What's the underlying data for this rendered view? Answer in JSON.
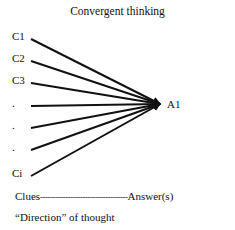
{
  "title": "Convergent thinking",
  "clues": [
    {
      "label": "C1",
      "y": 39
    },
    {
      "label": "C2",
      "y": 61
    },
    {
      "label": "C3",
      "y": 83
    },
    {
      "label": ".",
      "y": 106
    },
    {
      "label": ".",
      "y": 128
    },
    {
      "label": ".",
      "y": 150
    },
    {
      "label": "Ci",
      "y": 176
    }
  ],
  "answer": "A1",
  "axis": {
    "left": "Clues",
    "dashes": "-----------------------------------",
    "right": "Answer(s)"
  },
  "caption": "“Direction” of thought",
  "colors": {
    "line": "#111111"
  }
}
